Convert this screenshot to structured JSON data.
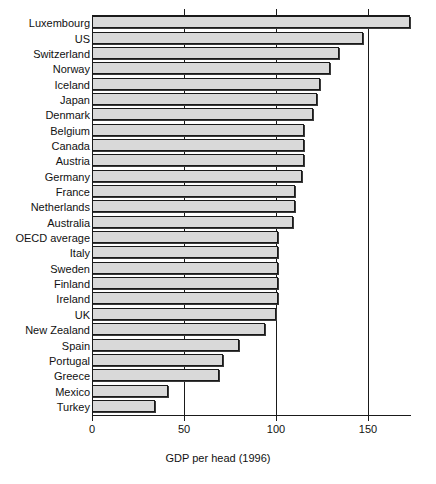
{
  "chart_data": {
    "type": "bar",
    "orientation": "horizontal",
    "title": "",
    "xlabel": "GDP per head (1996)",
    "ylabel": "",
    "xlim": [
      0,
      173
    ],
    "xticks": [
      0,
      50,
      100,
      150
    ],
    "xtick_labels": [
      "0",
      "50",
      "100",
      "150"
    ],
    "grid": "vertical gridlines at 50, 100, 150",
    "legend": "none",
    "bar_fill_color": "#d9d9d9",
    "bar_edge_color": "#1a1a1a",
    "categories": [
      "Luxembourg",
      "US",
      "Switzerland",
      "Norway",
      "Iceland",
      "Japan",
      "Denmark",
      "Belgium",
      "Canada",
      "Austria",
      "Germany",
      "France",
      "Netherlands",
      "Australia",
      "OECD average",
      "Italy",
      "Sweden",
      "Finland",
      "Ireland",
      "UK",
      "New Zealand",
      "Spain",
      "Portugal",
      "Greece",
      "Mexico",
      "Turkey"
    ],
    "values": [
      172,
      146,
      133,
      128,
      123,
      121,
      119,
      114,
      114,
      114,
      113,
      109,
      109,
      108,
      100,
      100,
      100,
      100,
      100,
      99,
      93,
      79,
      70,
      68,
      40,
      33
    ]
  },
  "axis": {
    "x_title": "GDP per head (1996)"
  }
}
